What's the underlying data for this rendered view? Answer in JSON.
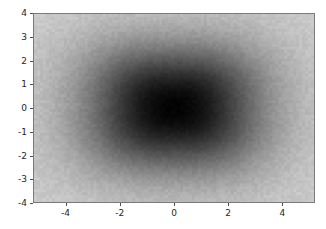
{
  "figure": {
    "background_color": "#ffffff",
    "width": 326,
    "height": 229
  },
  "axes": {
    "left": 33,
    "top": 13,
    "width": 282,
    "height": 190,
    "spine_color": "#7a7a7a",
    "tick_color": "#4d4d4d",
    "tick_label_color": "#262626"
  },
  "chart_data": {
    "type": "heatmap",
    "title": "",
    "xlabel": "",
    "ylabel": "",
    "colormap": "gray_r",
    "colorbar": false,
    "grid": false,
    "legend": null,
    "xlim": [
      -5.2,
      5.2
    ],
    "ylim": [
      -4.0,
      4.0
    ],
    "xticks": [
      -4,
      -2,
      0,
      2,
      4
    ],
    "xticklabels": [
      "-4",
      "-2",
      "0",
      "2",
      "4"
    ],
    "yticks": [
      4,
      3,
      2,
      1,
      0,
      -1,
      -2,
      -3,
      -4
    ],
    "yticklabels": [
      "4",
      "3",
      "2",
      "1",
      "0",
      "-1",
      "-2",
      "-3",
      "-4"
    ],
    "value_range": [
      0.0,
      1.0
    ],
    "field_model": {
      "form": "superellipse_radial_falloff",
      "center": [
        0.0,
        0.0
      ],
      "sigma_x": 3.2,
      "sigma_y": 2.6,
      "exponent": 2.6,
      "min_gray": 3,
      "max_gray": 205,
      "noise_amplitude": 7
    },
    "sampled_grid": {
      "x": [
        -5.2,
        -3.9,
        -2.6,
        -1.3,
        0.0,
        1.3,
        2.6,
        3.9,
        5.2
      ],
      "y": [
        4.0,
        3.0,
        2.0,
        1.0,
        0.0,
        -1.0,
        -2.0,
        -3.0,
        -4.0
      ],
      "values": [
        [
          0.78,
          0.62,
          0.44,
          0.33,
          0.3,
          0.33,
          0.44,
          0.62,
          0.78
        ],
        [
          0.66,
          0.47,
          0.28,
          0.16,
          0.12,
          0.16,
          0.28,
          0.47,
          0.66
        ],
        [
          0.58,
          0.36,
          0.16,
          0.05,
          0.03,
          0.05,
          0.16,
          0.36,
          0.58
        ],
        [
          0.54,
          0.3,
          0.1,
          0.01,
          0.0,
          0.01,
          0.1,
          0.3,
          0.54
        ],
        [
          0.52,
          0.28,
          0.08,
          0.0,
          0.0,
          0.0,
          0.08,
          0.28,
          0.52
        ],
        [
          0.54,
          0.3,
          0.1,
          0.01,
          0.0,
          0.01,
          0.1,
          0.3,
          0.54
        ],
        [
          0.58,
          0.36,
          0.16,
          0.05,
          0.03,
          0.05,
          0.16,
          0.36,
          0.58
        ],
        [
          0.66,
          0.47,
          0.28,
          0.16,
          0.12,
          0.16,
          0.28,
          0.47,
          0.66
        ],
        [
          0.78,
          0.62,
          0.44,
          0.33,
          0.3,
          0.33,
          0.44,
          0.62,
          0.78
        ]
      ]
    }
  }
}
